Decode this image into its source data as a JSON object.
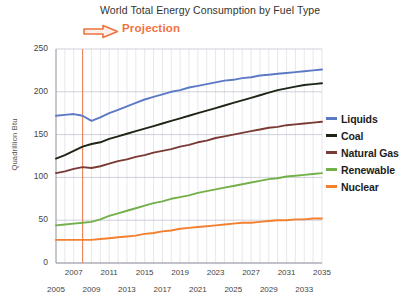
{
  "chart_data": {
    "type": "line",
    "title": "World Total Energy Consumption by Fuel Type",
    "xlabel": "",
    "ylabel": "Quadrillion Btu",
    "ylim": [
      0,
      250
    ],
    "yticks": [
      0,
      50,
      100,
      150,
      200,
      250
    ],
    "xlim": [
      2005,
      2035
    ],
    "grid": true,
    "legend_position": "right",
    "annotations": [
      {
        "text": "Projection",
        "type": "projection-marker",
        "color": "#f1713f",
        "at_x": 2008,
        "icon": "right-arrow-icon"
      }
    ],
    "xticks_upper": [
      2007,
      2011,
      2015,
      2019,
      2023,
      2027,
      2031,
      2035
    ],
    "xticks_lower": [
      2005,
      2009,
      2013,
      2017,
      2021,
      2025,
      2029,
      2033
    ],
    "x": [
      2005,
      2006,
      2007,
      2008,
      2009,
      2010,
      2011,
      2012,
      2013,
      2014,
      2015,
      2016,
      2017,
      2018,
      2019,
      2020,
      2021,
      2022,
      2023,
      2024,
      2025,
      2026,
      2027,
      2028,
      2029,
      2030,
      2031,
      2032,
      2033,
      2034,
      2035
    ],
    "series": [
      {
        "name": "Liquids",
        "color": "#5b79c4",
        "values": [
          172,
          173,
          174,
          172,
          166,
          170,
          175,
          179,
          183,
          187,
          191,
          194,
          197,
          200,
          202,
          205,
          207,
          209,
          211,
          213,
          214,
          216,
          217,
          219,
          220,
          221,
          222,
          223,
          224,
          225,
          226
        ]
      },
      {
        "name": "Coal",
        "color": "#1d2616",
        "values": [
          122,
          126,
          131,
          136,
          139,
          141,
          145,
          148,
          151,
          154,
          157,
          160,
          163,
          166,
          169,
          172,
          175,
          178,
          181,
          184,
          187,
          190,
          193,
          196,
          199,
          202,
          204,
          206,
          208,
          209,
          210
        ]
      },
      {
        "name": "Natural Gas",
        "color": "#7a3b35",
        "values": [
          105,
          107,
          110,
          112,
          111,
          113,
          116,
          119,
          121,
          124,
          126,
          129,
          131,
          133,
          136,
          138,
          141,
          143,
          146,
          148,
          150,
          152,
          154,
          156,
          158,
          159,
          161,
          162,
          163,
          164,
          165
        ]
      },
      {
        "name": "Renewable",
        "color": "#74b04a",
        "values": [
          44,
          45,
          46,
          47,
          48,
          51,
          55,
          58,
          61,
          64,
          67,
          70,
          72,
          75,
          77,
          79,
          82,
          84,
          86,
          88,
          90,
          92,
          94,
          96,
          98,
          99,
          101,
          102,
          103,
          104,
          105
        ]
      },
      {
        "name": "Nuclear",
        "color": "#f2802f",
        "values": [
          27,
          27,
          27,
          27,
          27,
          28,
          29,
          30,
          31,
          32,
          34,
          35,
          37,
          38,
          40,
          41,
          42,
          43,
          44,
          45,
          46,
          47,
          47,
          48,
          49,
          50,
          50,
          51,
          51,
          52,
          52
        ]
      }
    ]
  },
  "legend": {
    "items": [
      {
        "label": "Liquids",
        "color": "#5b79c4"
      },
      {
        "label": "Coal",
        "color": "#1d2616"
      },
      {
        "label": "Natural Gas",
        "color": "#7a3b35"
      },
      {
        "label": "Renewable",
        "color": "#74b04a"
      },
      {
        "label": "Nuclear",
        "color": "#f2802f"
      }
    ]
  }
}
